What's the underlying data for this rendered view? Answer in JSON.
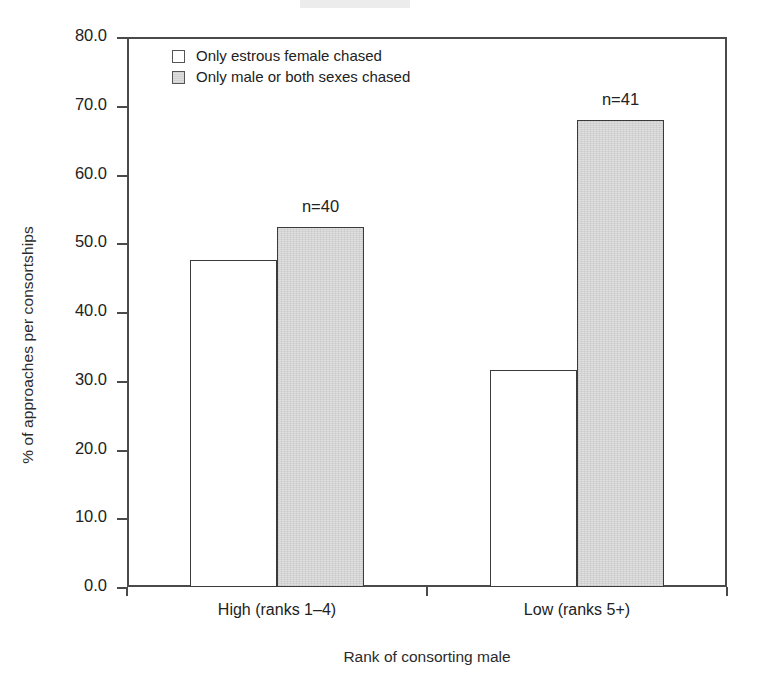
{
  "chart_data": {
    "type": "bar",
    "title": "",
    "subtitle": "",
    "xlabel": "Rank of consorting male",
    "ylabel": "% of approaches per consortships",
    "categories": [
      "High (ranks 1–4)",
      "Low (ranks 5+)"
    ],
    "series": [
      {
        "name": "Only estrous female chased",
        "style": "open",
        "values": [
          47.5,
          31.5
        ]
      },
      {
        "name": "Only male or both sexes chased",
        "style": "filled",
        "values": [
          52.3,
          68.0
        ]
      }
    ],
    "annotations": [
      {
        "text": "n=40",
        "category": "High (ranks 1–4)",
        "value": 55.0
      },
      {
        "text": "n=41",
        "category": "Low (ranks 5+)",
        "value": 70.5
      }
    ],
    "ylim": [
      0.0,
      80.0
    ],
    "ytick_step": 10.0,
    "ytick_labels": [
      "0.0",
      "10.0",
      "20.0",
      "30.0",
      "40.0",
      "50.0",
      "60.0",
      "70.0",
      "80.0"
    ],
    "ytick_values": [
      0,
      10,
      20,
      30,
      40,
      50,
      60,
      70,
      80
    ],
    "grid": false,
    "legend_position": "top-left",
    "colors": {
      "open_fill": "#ffffff",
      "filled_fill": "#dcdcdc",
      "bar_outline": "#3b3b3b",
      "axis": "#4a4a4a",
      "text": "#222222",
      "background": "#ffffff"
    }
  },
  "legend": {
    "entries": [
      {
        "label": "Only estrous female chased",
        "style": "open"
      },
      {
        "label": "Only male or both sexes chased",
        "style": "filled"
      }
    ]
  },
  "axes": {
    "x_title": "Rank of consorting male",
    "y_title": "% of approaches per consortships"
  }
}
